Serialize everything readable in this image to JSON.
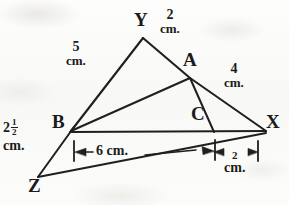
{
  "figure": {
    "ink_color": "#1b1b1b",
    "paper_color": "#fbfbfa",
    "width": 289,
    "height": 205
  },
  "vertices": [
    {
      "key": "Y",
      "label": "Y",
      "x": 140,
      "y": 20,
      "point_x": 143,
      "point_y": 38
    },
    {
      "key": "A",
      "label": "A",
      "x": 188,
      "y": 58,
      "point_x": 190,
      "point_y": 78
    },
    {
      "key": "B",
      "label": "B",
      "x": 57,
      "y": 120,
      "point_x": 71,
      "point_y": 131
    },
    {
      "key": "C",
      "label": "C",
      "x": 196,
      "y": 112,
      "point_x": 214,
      "point_y": 131
    },
    {
      "key": "X",
      "label": "X",
      "x": 268,
      "y": 120,
      "point_x": 266,
      "point_y": 131
    },
    {
      "key": "Z",
      "label": "Z",
      "x": 30,
      "y": 183,
      "point_x": 38,
      "point_y": 177
    }
  ],
  "measurements": [
    {
      "id": "ya-length",
      "number": "2",
      "unit": "cm.",
      "side": "Y to A",
      "x": 168,
      "y": 14
    },
    {
      "id": "yb-length",
      "number": "5",
      "unit": "cm.",
      "side": "Y to B",
      "x": 74,
      "y": 46
    },
    {
      "id": "ax-length",
      "number": "4",
      "unit": "cm.",
      "side": "A to X",
      "x": 232,
      "y": 70
    },
    {
      "id": "bz-length",
      "number": "2",
      "fraction_numerator": "1",
      "fraction_denominator": "2",
      "unit": "cm.",
      "side": "B to Z",
      "x": 4,
      "y": 124
    },
    {
      "id": "bc-baseline",
      "number": "6",
      "unit": "cm.",
      "side": "B to C baseline",
      "x": 100,
      "y": 146
    },
    {
      "id": "cx-baseline",
      "number": "2",
      "unit": "cm.",
      "side": "C to X baseline",
      "x": 222,
      "y": 157
    }
  ],
  "dimension_lines": [
    {
      "id": "dim-6cm",
      "label": "6 cm.",
      "from_x": 74,
      "to_x": 215,
      "y": 152,
      "arrows": "both"
    },
    {
      "id": "dim-2cm",
      "label": "2 cm.",
      "from_x": 215,
      "to_x": 258,
      "y": 152,
      "arrows": "both"
    }
  ],
  "segments": [
    {
      "id": "seg-y-b",
      "from": "Y",
      "to": "B"
    },
    {
      "id": "seg-y-x",
      "from": "Y",
      "to": "X",
      "passes_through": "A"
    },
    {
      "id": "seg-b-a",
      "from": "B",
      "to": "A"
    },
    {
      "id": "seg-a-c",
      "from": "A",
      "to": "C"
    },
    {
      "id": "seg-b-x",
      "from": "B",
      "to": "X"
    },
    {
      "id": "seg-b-z",
      "from": "B",
      "to": "Z"
    },
    {
      "id": "seg-z-x",
      "from": "Z",
      "to": "X"
    }
  ]
}
